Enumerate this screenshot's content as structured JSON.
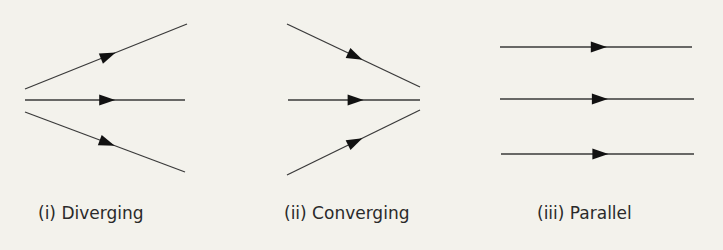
{
  "panels": [
    {
      "label": "(i) Diverging",
      "rays": [
        {
          "x1": 25,
          "y1": 89,
          "x2": 187,
          "y2": 24
        },
        {
          "x1": 25,
          "y1": 100,
          "x2": 185,
          "y2": 100
        },
        {
          "x1": 25,
          "y1": 112,
          "x2": 185,
          "y2": 172
        }
      ]
    },
    {
      "label": "(ii) Converging",
      "rays": [
        {
          "x1": 287,
          "y1": 24,
          "x2": 420,
          "y2": 87
        },
        {
          "x1": 288,
          "y1": 100,
          "x2": 420,
          "y2": 100
        },
        {
          "x1": 287,
          "y1": 175,
          "x2": 420,
          "y2": 110
        }
      ]
    },
    {
      "label": "(iii) Parallel",
      "rays": [
        {
          "x1": 500,
          "y1": 47,
          "x2": 692,
          "y2": 47
        },
        {
          "x1": 500,
          "y1": 99,
          "x2": 694,
          "y2": 99
        },
        {
          "x1": 501,
          "y1": 154,
          "x2": 694,
          "y2": 154
        }
      ]
    }
  ],
  "colors": {
    "line": "#3a3a3a",
    "arrow": "#111111",
    "background": "#f3f2ec",
    "text": "#2a2a2a"
  }
}
